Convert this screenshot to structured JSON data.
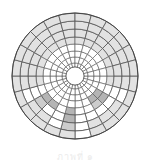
{
  "diagram": {
    "type": "polar-grid",
    "center": [
      75,
      76
    ],
    "ring_radii": [
      9,
      13,
      19,
      25,
      32,
      39,
      47,
      55,
      63
    ],
    "sectors": 24,
    "colors": {
      "line": "#555555",
      "blank": "#ffffff",
      "light": "#e2e2e2",
      "dark": "#b4b4b4",
      "medium": "#cccccc"
    },
    "light_rule": {
      "outer_rings_top": 4,
      "outer_rings_bottom": 2
    },
    "dark_cells": [
      {
        "sector": 6,
        "ring": 4,
        "shade": "dark"
      },
      {
        "sector": 6,
        "ring": 5,
        "shade": "dark"
      },
      {
        "sector": 6,
        "ring": 6,
        "shade": "medium"
      },
      {
        "sector": 2,
        "ring": 3,
        "shade": "dark"
      },
      {
        "sector": 2,
        "ring": 4,
        "shade": "dark"
      },
      {
        "sector": 3,
        "ring": 3,
        "shade": "dark"
      },
      {
        "sector": 3,
        "ring": 4,
        "shade": "medium"
      },
      {
        "sector": 8,
        "ring": 4,
        "shade": "dark"
      },
      {
        "sector": 9,
        "ring": 4,
        "shade": "dark"
      },
      {
        "sector": 9,
        "ring": 5,
        "shade": "medium"
      }
    ],
    "white_cells": [
      {
        "sector": 5,
        "ring": 6
      },
      {
        "sector": 5,
        "ring": 7
      },
      {
        "sector": 7,
        "ring": 6
      },
      {
        "sector": 10,
        "ring": 6
      },
      {
        "sector": 1,
        "ring": 6
      }
    ]
  },
  "caption": "ภาพที่ ๑"
}
